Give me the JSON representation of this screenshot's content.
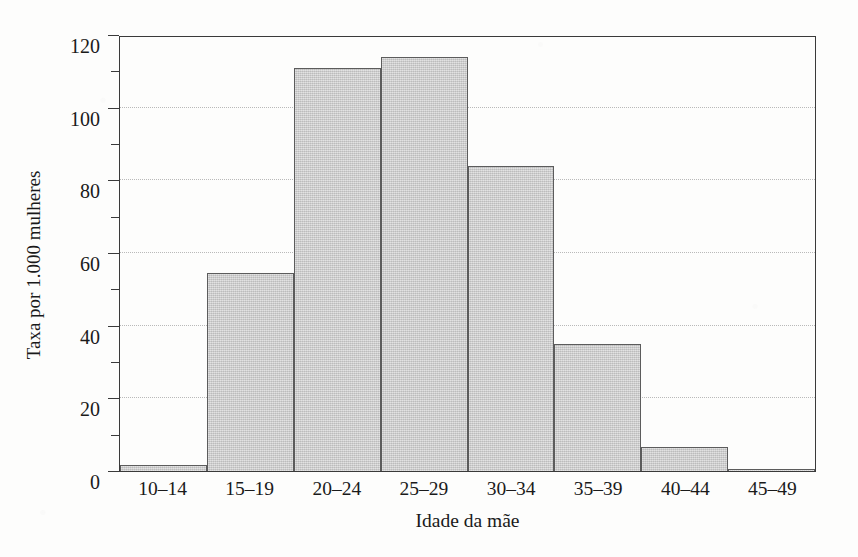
{
  "chart_data": {
    "type": "bar",
    "title": "",
    "subtitle": "",
    "xlabel": "Idade da mãe",
    "ylabel": "Taxa por 1.000 mulheres",
    "categories": [
      "10–14",
      "15–19",
      "20–24",
      "25–29",
      "30–34",
      "35–39",
      "40–44",
      "45–49"
    ],
    "values": [
      1.7,
      54.5,
      111,
      114,
      84,
      35,
      6.5,
      0.6
    ],
    "series": [
      {
        "name": "Taxa de natalidade por 1.000 mulheres",
        "values": [
          1.7,
          54.5,
          111,
          114,
          84,
          35,
          6.5,
          0.6
        ]
      }
    ],
    "ylim": [
      0,
      120
    ],
    "y_major_ticks": [
      0,
      20,
      40,
      60,
      80,
      100,
      120
    ],
    "y_minor_ticks": [
      10,
      30,
      50,
      70,
      90,
      110
    ],
    "y_tick_labels": [
      "0",
      "20",
      "40",
      "60",
      "80",
      "100",
      "120"
    ],
    "grid": "horizontal-dotted-at-major-ticks",
    "legend": "none",
    "bar_fill_color": "#c9c9c9",
    "bar_edge_color": "#5c5c5c",
    "axis_color": "#3a3a3a",
    "background_color": "#fdfdfc",
    "annotations": []
  },
  "axes": {
    "y_title": "Taxa por 1.000 mulheres",
    "x_title": "Idade da mãe"
  }
}
